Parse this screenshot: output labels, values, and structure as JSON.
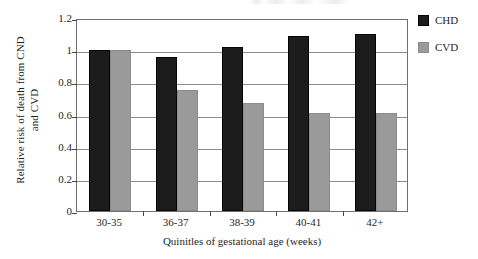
{
  "chart_data": {
    "type": "bar",
    "title": "",
    "subtitle": "",
    "xlabel": "Quinitles of gestational age (weeks)",
    "ylabel": "Relative risk of death from CND\nand CVD",
    "categories": [
      "30-35",
      "36-37",
      "38-39",
      "40-41",
      "42+"
    ],
    "series": [
      {
        "name": "CHD",
        "color": "#1c1c1c",
        "values": [
          1.0,
          0.96,
          1.02,
          1.09,
          1.1
        ]
      },
      {
        "name": "CVD",
        "color": "#9a9a9a",
        "values": [
          1.0,
          0.75,
          0.67,
          0.61,
          0.61
        ]
      }
    ],
    "ylim": [
      0,
      1.2
    ],
    "yticks": [
      0,
      0.2,
      0.4,
      0.6,
      0.8,
      1,
      1.2
    ],
    "ytick_labels": [
      "0",
      "0.2",
      "0.4",
      "0.6",
      "0.8",
      "1",
      "1.2"
    ],
    "grid": true,
    "grid_axis": "y",
    "legend_position": "right",
    "legend": [
      "CHD",
      "CVD"
    ]
  },
  "colors": {
    "chd": "#1c1c1c",
    "cvd": "#9a9a9a",
    "grid": "#8d8d8d",
    "frame": "#6f6f6f",
    "text": "#1f1f1f",
    "background": "#ffffff"
  }
}
